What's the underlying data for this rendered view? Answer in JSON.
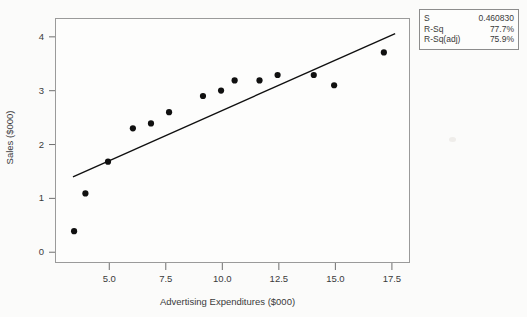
{
  "chart_data": {
    "type": "scatter",
    "title": "",
    "xlabel": "Advertising Expenditures ($000)",
    "ylabel": "Sales ($000)",
    "xlim": [
      2.6,
      18.3
    ],
    "ylim": [
      -0.2,
      4.35
    ],
    "xticks": [
      "5.0",
      "7.5",
      "10.0",
      "12.5",
      "15.0",
      "17.5"
    ],
    "xtick_values": [
      5.0,
      7.5,
      10.0,
      12.5,
      15.0,
      17.5
    ],
    "yticks": [
      "0",
      "1",
      "2",
      "3",
      "4"
    ],
    "ytick_values": [
      0,
      1,
      2,
      3,
      4
    ],
    "grid": false,
    "legend": "none",
    "marker": "filled-circle",
    "marker_color": "#101010",
    "line_color": "#101010",
    "points": [
      {
        "x": 3.4,
        "y": 0.41
      },
      {
        "x": 3.9,
        "y": 1.11
      },
      {
        "x": 4.9,
        "y": 1.7
      },
      {
        "x": 6.0,
        "y": 2.32
      },
      {
        "x": 6.8,
        "y": 2.41
      },
      {
        "x": 7.6,
        "y": 2.62
      },
      {
        "x": 9.1,
        "y": 2.92
      },
      {
        "x": 9.9,
        "y": 3.02
      },
      {
        "x": 10.5,
        "y": 3.21
      },
      {
        "x": 11.6,
        "y": 3.21
      },
      {
        "x": 12.4,
        "y": 3.31
      },
      {
        "x": 14.0,
        "y": 3.31
      },
      {
        "x": 14.9,
        "y": 3.12
      },
      {
        "x": 17.1,
        "y": 3.73
      }
    ],
    "fit_line": {
      "name": "regression-line",
      "x0": 3.35,
      "y0": 1.42,
      "x1": 17.6,
      "y1": 4.08
    }
  },
  "stats": {
    "rows": [
      {
        "key": "S",
        "value": "0.460830"
      },
      {
        "key": "R-Sq",
        "value": "77.7%"
      },
      {
        "key": "R-Sq(adj)",
        "value": "75.9%"
      }
    ]
  }
}
